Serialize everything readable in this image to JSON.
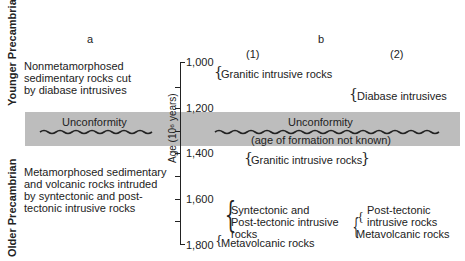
{
  "diagram": {
    "eras": {
      "younger": "Younger Precambrian",
      "older": "Older Precambrian"
    },
    "columns": {
      "a": "a",
      "b": "b",
      "b1": "(1)",
      "b2": "(2)"
    },
    "column_a": {
      "upper_text": [
        "Nonmetamorphosed",
        "sedimentary rocks cut",
        "by diabase intrusives"
      ],
      "unconformity": "Unconformity",
      "lower_text": [
        "Metamorphosed sedimentary",
        "and volcanic rocks intruded",
        "by syntectonic and post-",
        "tectonic intrusive rocks"
      ]
    },
    "axis": {
      "label": "Age (10⁶ years)",
      "ticks": [
        "1,000",
        "1,200",
        "1,400",
        "1,600",
        "1,800"
      ]
    },
    "column_b": {
      "unconformity": "Unconformity",
      "unconformity_note": "(age of formation not known)",
      "col1": {
        "granitic_upper": "Granitic intrusive rocks",
        "granitic_lower": "Granitic intrusive rocks",
        "syntectonic": [
          "Syntectonic and",
          "Post-tectonic intrusive",
          "rocks"
        ],
        "metavolcanic": "Metavolcanic rocks"
      },
      "col2": {
        "diabase": "Diabase intrusives",
        "posttectonic": [
          "Post-tectonic",
          "intrusive rocks"
        ],
        "metavolcanic": "Metavolcanic rocks"
      }
    },
    "colors": {
      "band": "#bdbdbd",
      "ink": "#222222"
    }
  }
}
